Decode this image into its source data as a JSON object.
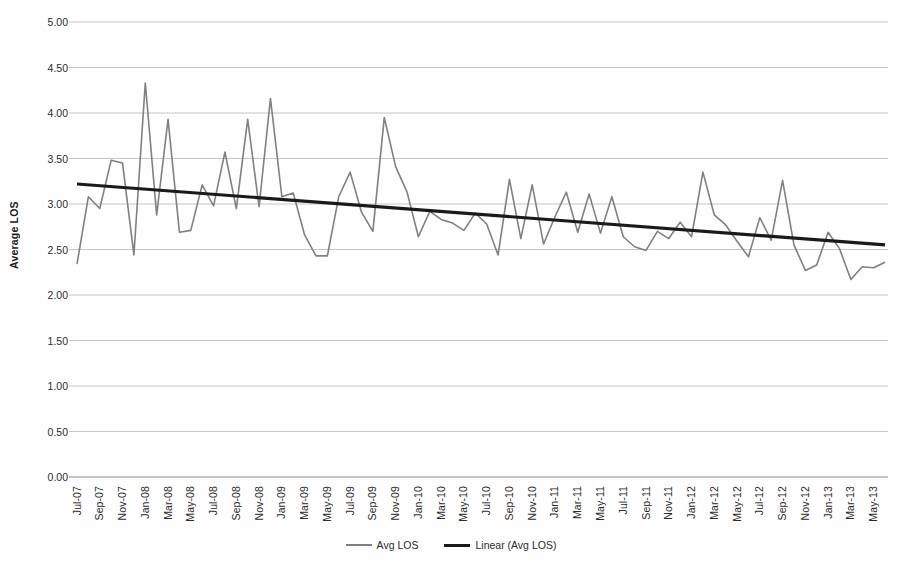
{
  "chart_data": {
    "type": "line",
    "title": "",
    "xlabel": "",
    "ylabel": "Average LOS",
    "ylim": [
      0,
      5
    ],
    "ytick_step": 0.5,
    "grid": true,
    "legend_position": "bottom",
    "ytick_labels": [
      "0.00",
      "0.50",
      "1.00",
      "1.50",
      "2.00",
      "2.50",
      "3.00",
      "3.50",
      "4.00",
      "4.50",
      "5.00"
    ],
    "xtick_labels": [
      "Jul-07",
      "Sep-07",
      "Nov-07",
      "Jan-08",
      "Mar-08",
      "May-08",
      "Jul-08",
      "Sep-08",
      "Nov-08",
      "Jan-09",
      "Mar-09",
      "May-09",
      "Jul-09",
      "Sep-09",
      "Nov-09",
      "Jan-10",
      "Mar-10",
      "May-10",
      "Jul-10",
      "Sep-10",
      "Nov-10",
      "Jan-11",
      "Mar-11",
      "May-11",
      "Jul-11",
      "Sep-11",
      "Nov-11",
      "Jan-12",
      "Mar-12",
      "May-12",
      "Jul-12",
      "Sep-12",
      "Nov-12",
      "Jan-13",
      "Mar-13",
      "May-13"
    ],
    "x": [
      "Jul-07",
      "Aug-07",
      "Sep-07",
      "Oct-07",
      "Nov-07",
      "Dec-07",
      "Jan-08",
      "Feb-08",
      "Mar-08",
      "Apr-08",
      "May-08",
      "Jun-08",
      "Jul-08",
      "Aug-08",
      "Sep-08",
      "Oct-08",
      "Nov-08",
      "Dec-08",
      "Jan-09",
      "Feb-09",
      "Mar-09",
      "Apr-09",
      "May-09",
      "Jun-09",
      "Jul-09",
      "Aug-09",
      "Sep-09",
      "Oct-09",
      "Nov-09",
      "Dec-09",
      "Jan-10",
      "Feb-10",
      "Mar-10",
      "Apr-10",
      "May-10",
      "Jun-10",
      "Jul-10",
      "Aug-10",
      "Sep-10",
      "Oct-10",
      "Nov-10",
      "Dec-10",
      "Jan-11",
      "Feb-11",
      "Mar-11",
      "Apr-11",
      "May-11",
      "Jun-11",
      "Jul-11",
      "Aug-11",
      "Sep-11",
      "Oct-11",
      "Nov-11",
      "Dec-11",
      "Jan-12",
      "Feb-12",
      "Mar-12",
      "Apr-12",
      "May-12",
      "Jun-12",
      "Jul-12",
      "Aug-12",
      "Sep-12",
      "Oct-12",
      "Nov-12",
      "Dec-12",
      "Jan-13",
      "Feb-13",
      "Mar-13",
      "Apr-13",
      "May-13",
      "Jun-13"
    ],
    "series": [
      {
        "name": "Avg LOS",
        "color": "#808080",
        "style": "line",
        "width": 1.6,
        "values": [
          2.34,
          3.08,
          2.95,
          3.48,
          3.45,
          2.44,
          4.33,
          2.88,
          3.93,
          2.69,
          2.71,
          3.21,
          2.98,
          3.57,
          2.95,
          3.93,
          2.97,
          4.16,
          3.08,
          3.12,
          2.66,
          2.43,
          2.43,
          3.08,
          3.35,
          2.91,
          2.7,
          3.95,
          3.41,
          3.13,
          2.64,
          2.92,
          2.83,
          2.79,
          2.71,
          2.9,
          2.78,
          2.44,
          3.27,
          2.62,
          3.21,
          2.56,
          2.86,
          3.13,
          2.69,
          3.11,
          2.68,
          3.08,
          2.64,
          2.53,
          2.49,
          2.7,
          2.62,
          2.8,
          2.64,
          3.35,
          2.88,
          2.77,
          2.59,
          2.42,
          2.85,
          2.6,
          3.26,
          2.55,
          2.27,
          2.33,
          2.69,
          2.51,
          2.17,
          2.31,
          2.3,
          2.36
        ]
      },
      {
        "name": "Linear (Avg LOS)",
        "color": "#1a1a1a",
        "style": "trendline",
        "width": 3.2,
        "start_value": 3.22,
        "end_value": 2.55
      }
    ],
    "legend": [
      {
        "label": "Avg LOS",
        "color": "#808080",
        "kind": "series"
      },
      {
        "label": "Linear (Avg LOS)",
        "color": "#1a1a1a",
        "kind": "trend"
      }
    ]
  },
  "colors": {
    "background": "#fefefe",
    "gridline": "#bfbfbf",
    "axis": "#8c8c8c",
    "series": "#808080",
    "trend": "#1a1a1a",
    "text": "#2b2b2b"
  }
}
